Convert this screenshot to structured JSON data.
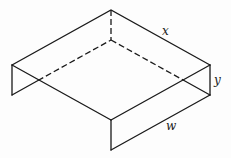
{
  "diagram": {
    "type": "open-top box (isometric)",
    "labels": {
      "x": "x",
      "y": "y",
      "w": "w"
    },
    "colors": {
      "stroke": "#1a1a1a",
      "background": "#fdfdfd"
    }
  }
}
